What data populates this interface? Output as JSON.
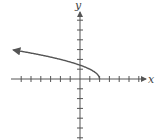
{
  "chart_data": {
    "type": "line",
    "title": "",
    "xlabel": "x",
    "ylabel": "y",
    "function": "y = sqrt(2 - x)",
    "xlim": [
      -7,
      7
    ],
    "ylim": [
      -6,
      7
    ],
    "tick_step": 1,
    "grid": false,
    "series": [
      {
        "name": "curve",
        "x": [
          -6.8,
          -6,
          -4,
          -2,
          0,
          1,
          1.5,
          2
        ],
        "y": [
          2.97,
          2.83,
          2.45,
          2.0,
          1.41,
          1.0,
          0.71,
          0.0
        ],
        "left_arrow": true,
        "endpoint": [
          2,
          0
        ]
      }
    ]
  },
  "colors": {
    "axis": "#555555",
    "curve": "#555555"
  },
  "labels": {
    "x_axis": "x",
    "y_axis": "y"
  }
}
